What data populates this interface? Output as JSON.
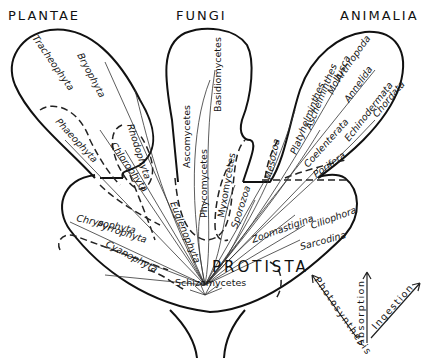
{
  "diagram": {
    "kingdoms": {
      "plantae": "PLANTAE",
      "fungi": "FUNGI",
      "animalia": "ANIMALIA",
      "protista": "PROTISTA"
    },
    "plantae_groups": [
      "Tracheophyta",
      "Bryophyta",
      "Rhodophyta",
      "Chlorophyta",
      "Phaeophyta"
    ],
    "fungi_groups": [
      "Ascomycetes",
      "Basidiomycetes",
      "Phycomycetes",
      "Myxomycetes",
      "Sporozoa"
    ],
    "animalia_groups": [
      "Mollusca",
      "Arthropoda",
      "Annelida",
      "Chordata",
      "Echinodermata",
      "Aschelminthes",
      "Platyhelminthes",
      "Mesozoa",
      "Coelenterata",
      "Porifera"
    ],
    "protista_groups": [
      "Chrysophyta",
      "Euglenophyta",
      "Pyrrophyta",
      "Cyanophyta",
      "Schizomycetes",
      "Zoomastigina",
      "Ciliophora",
      "Sarcodina"
    ],
    "nutrition_modes": {
      "photosynthesis": "Photosynthesis",
      "absorption": "Absorption",
      "ingestion": "Ingestion"
    },
    "colors": {
      "ink": "#111111",
      "background": "#ffffff"
    }
  }
}
